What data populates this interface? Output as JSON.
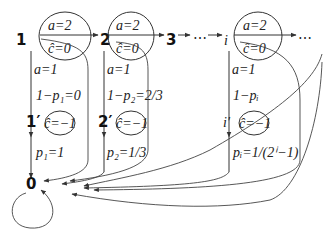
{
  "diagram": {
    "states": [
      {
        "id": "1",
        "label": "1",
        "top": "a=2",
        "bottom": "ĉ=0"
      },
      {
        "id": "2",
        "label": "2",
        "top": "a=2",
        "bottom": "ĉ=0"
      },
      {
        "id": "3",
        "label": "3"
      },
      {
        "id": "dots1",
        "label": "⋯"
      },
      {
        "id": "i",
        "label": "i",
        "top": "a=2",
        "bottom": "ĉ=0"
      },
      {
        "id": "dots2",
        "label": "⋯"
      }
    ],
    "primed_states": [
      {
        "id": "1p",
        "label": "1′",
        "value": "ĉ=−1"
      },
      {
        "id": "2p",
        "label": "2′",
        "value": "ĉ=−1"
      },
      {
        "id": "ip",
        "label": "i′",
        "value": "ĉ=−1"
      }
    ],
    "sink": {
      "label": "0"
    },
    "edge_labels": {
      "col1": {
        "a": "a=1",
        "q": "1−p₁=0",
        "p": "p₁=1"
      },
      "col2": {
        "a": "a=1",
        "q": "1−p₂=2/3",
        "p": "p₂=1/3"
      },
      "coli": {
        "a": "a=1",
        "q": "1−pᵢ",
        "p": "pᵢ=1/(2ⁱ−1)"
      }
    }
  }
}
